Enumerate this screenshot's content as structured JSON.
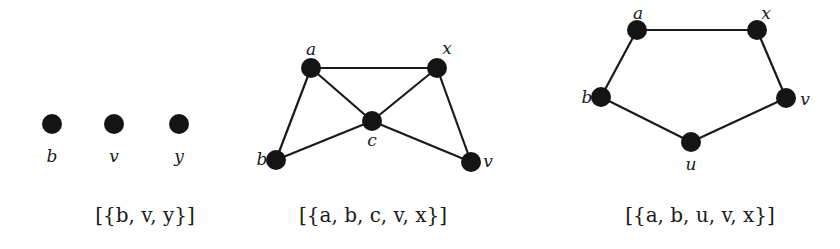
{
  "graphs": [
    {
      "id": "graph-1",
      "caption": "[{b, v, y}]",
      "caption_pos": [
        145,
        222
      ],
      "nodes": [
        {
          "id": "b",
          "label": "b",
          "x": 52,
          "y": 124,
          "lx": 52,
          "ly": 162,
          "anchor": "middle"
        },
        {
          "id": "v",
          "label": "v",
          "x": 114,
          "y": 124,
          "lx": 114,
          "ly": 162,
          "anchor": "middle"
        },
        {
          "id": "y",
          "label": "y",
          "x": 179,
          "y": 124,
          "lx": 179,
          "ly": 162,
          "anchor": "middle"
        }
      ],
      "edges": []
    },
    {
      "id": "graph-2",
      "caption": "[{a, b, c, v, x}]",
      "caption_pos": [
        373,
        222
      ],
      "nodes": [
        {
          "id": "a",
          "label": "a",
          "x": 311,
          "y": 68,
          "lx": 311,
          "ly": 55,
          "anchor": "middle"
        },
        {
          "id": "x",
          "label": "x",
          "x": 437,
          "y": 68,
          "lx": 447,
          "ly": 54,
          "anchor": "middle"
        },
        {
          "id": "c",
          "label": "c",
          "x": 372,
          "y": 121,
          "lx": 372,
          "ly": 146,
          "anchor": "middle"
        },
        {
          "id": "b",
          "label": "b",
          "x": 276,
          "y": 160,
          "lx": 262,
          "ly": 165,
          "anchor": "middle"
        },
        {
          "id": "v",
          "label": "v",
          "x": 471,
          "y": 162,
          "lx": 488,
          "ly": 167,
          "anchor": "middle"
        }
      ],
      "edges": [
        [
          "a",
          "x"
        ],
        [
          "a",
          "b"
        ],
        [
          "a",
          "c"
        ],
        [
          "x",
          "c"
        ],
        [
          "x",
          "v"
        ],
        [
          "b",
          "c"
        ],
        [
          "c",
          "v"
        ]
      ]
    },
    {
      "id": "graph-3",
      "caption": "[{a, b, u, v, x}]",
      "caption_pos": [
        700,
        222
      ],
      "nodes": [
        {
          "id": "a",
          "label": "a",
          "x": 637,
          "y": 30,
          "lx": 638,
          "ly": 19,
          "anchor": "middle"
        },
        {
          "id": "x",
          "label": "x",
          "x": 757,
          "y": 30,
          "lx": 766,
          "ly": 19,
          "anchor": "middle"
        },
        {
          "id": "b",
          "label": "b",
          "x": 601,
          "y": 97,
          "lx": 587,
          "ly": 103,
          "anchor": "middle"
        },
        {
          "id": "v",
          "label": "v",
          "x": 786,
          "y": 98,
          "lx": 805,
          "ly": 105,
          "anchor": "middle"
        },
        {
          "id": "u",
          "label": "u",
          "x": 691,
          "y": 142,
          "lx": 691,
          "ly": 170,
          "anchor": "middle"
        }
      ],
      "edges": [
        [
          "a",
          "x"
        ],
        [
          "a",
          "b"
        ],
        [
          "x",
          "v"
        ],
        [
          "b",
          "u"
        ],
        [
          "v",
          "u"
        ]
      ]
    }
  ],
  "style": {
    "node_radius": 10,
    "node_color": "#141414",
    "edge_color": "#1a1a1a"
  }
}
